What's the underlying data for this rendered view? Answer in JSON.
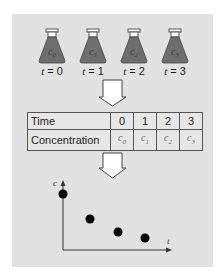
{
  "flasks": [
    {
      "content": "c",
      "subscript": "0",
      "time_label": "t",
      "time_value": "= 0"
    },
    {
      "content": "c",
      "subscript": "1",
      "time_label": "t",
      "time_value": "= 1"
    },
    {
      "content": "c",
      "subscript": "2",
      "time_label": "t",
      "time_value": "= 2"
    },
    {
      "content": "c",
      "subscript": "3",
      "time_label": "t",
      "time_value": "= 3"
    }
  ],
  "table": {
    "rows": [
      {
        "header": "Time",
        "cells": [
          "0",
          "1",
          "2",
          "3"
        ]
      },
      {
        "header": "Concentration",
        "cells": [
          "c0",
          "c1",
          "c2",
          "c3"
        ]
      }
    ]
  },
  "plot": {
    "y_axis_label": "c",
    "x_axis_label": "t",
    "points": [
      {
        "t": 0,
        "c": 4
      },
      {
        "t": 1,
        "c": 2.2
      },
      {
        "t": 2,
        "c": 1.4
      },
      {
        "t": 3,
        "c": 1.0
      }
    ]
  },
  "colors": {
    "panel_bg": "#e1e1e1",
    "flask_fill": "#6e6e6e",
    "flask_cap": "#ffffff",
    "point": "#000000",
    "arrow_fill": "#ffffff",
    "outline": "#444444"
  }
}
